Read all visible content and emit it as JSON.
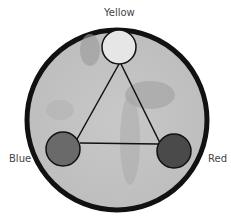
{
  "diagram": {
    "nodes": [
      {
        "id": "yellow",
        "label": "Yellow",
        "fill": "#e6e6e6"
      },
      {
        "id": "blue",
        "label": "Blue",
        "fill": "#6a6a6a"
      },
      {
        "id": "red",
        "label": "Red",
        "fill": "#4a4a4a"
      }
    ],
    "edges": [
      [
        "yellow",
        "blue"
      ],
      [
        "yellow",
        "red"
      ],
      [
        "blue",
        "red"
      ]
    ],
    "colors": {
      "ring": "#111111",
      "background": "#c4c4c4"
    }
  }
}
